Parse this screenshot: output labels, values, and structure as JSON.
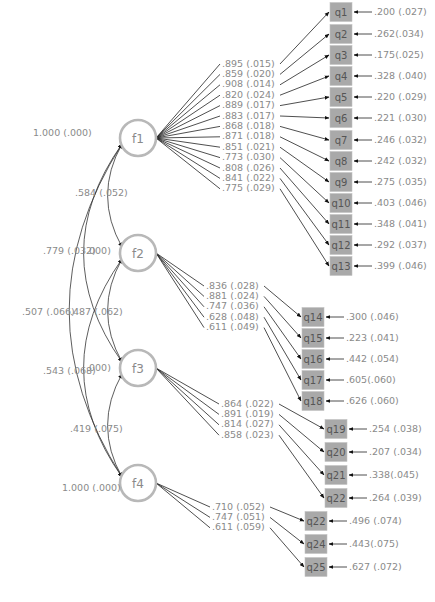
{
  "diagram": {
    "type": "confirmatory factor analysis path diagram",
    "factors": [
      {
        "id": "f1",
        "label": "f1",
        "variance": "1.000 (.000)",
        "cx": 138,
        "cy": 138
      },
      {
        "id": "f2",
        "label": "f2",
        "variance": ".000)",
        "cx": 138,
        "cy": 253
      },
      {
        "id": "f3",
        "label": "f3",
        "variance": ".000)",
        "cx": 138,
        "cy": 368
      },
      {
        "id": "f4",
        "label": "f4",
        "variance": "1.000 (.000)",
        "cx": 138,
        "cy": 483
      }
    ],
    "correlations": [
      {
        "from": "f1",
        "to": "f2",
        "label": ".584 (.052)"
      },
      {
        "from": "f1",
        "to": "f3",
        "label": ".779 (.032)"
      },
      {
        "from": "f1",
        "to": "f4",
        "label": ".507 (.066)"
      },
      {
        "from": "f2",
        "to": "f3",
        "label": ".487 (.062)"
      },
      {
        "from": "f2",
        "to": "f4",
        "label": ".543 (.068)"
      },
      {
        "from": "f3",
        "to": "f4",
        "label": ".419 (.075)"
      }
    ],
    "groups": [
      {
        "factor": "f1",
        "box_x": 330,
        "loading_label_x": 222,
        "loading_label_y0": 64,
        "items": [
          {
            "label": "q1",
            "loading": ".895 (.015)",
            "residual": ".200 (.027)",
            "y": 12
          },
          {
            "label": "q2",
            "loading": ".859 (.020)",
            "residual": ".262(.034)",
            "y": 34
          },
          {
            "label": "q3",
            "loading": ".908 (.014)",
            "residual": ".175(.025)",
            "y": 55
          },
          {
            "label": "q4",
            "loading": ".820 (.024)",
            "residual": ".328 (.040)",
            "y": 76
          },
          {
            "label": "q5",
            "loading": ".889 (.017)",
            "residual": ".220 (.029)",
            "y": 97
          },
          {
            "label": "q6",
            "loading": ".883 (.017)",
            "residual": ".221 (.030)",
            "y": 118
          },
          {
            "label": "q7",
            "loading": ".868 (.018)",
            "residual": ".246 (.032)",
            "y": 140
          },
          {
            "label": "q8",
            "loading": ".871 (.018)",
            "residual": ".242 (.032)",
            "y": 161
          },
          {
            "label": "q9",
            "loading": ".851 (.021)",
            "residual": ".275 (.035)",
            "y": 182
          },
          {
            "label": "q10",
            "loading": ".773 (.030)",
            "residual": ".403 (.046)",
            "y": 203
          },
          {
            "label": "q11",
            "loading": ".808 (.026)",
            "residual": ".348 (.041)",
            "y": 224
          },
          {
            "label": "q12",
            "loading": ".841 (.022)",
            "residual": ".292 (.037)",
            "y": 245
          },
          {
            "label": "q13",
            "loading": ".775 (.029)",
            "residual": ".399 (.046)",
            "y": 266
          }
        ]
      },
      {
        "factor": "f2",
        "box_x": 302,
        "loading_label_x": 206,
        "loading_label_y0": 286,
        "items": [
          {
            "label": "q14",
            "loading": ".836 (.028)",
            "residual": ".300 (.046)",
            "y": 317
          },
          {
            "label": "q15",
            "loading": ".881 (.024)",
            "residual": ".223 (.041)",
            "y": 338
          },
          {
            "label": "q16",
            "loading": ".747 (.036)",
            "residual": ".442 (.054)",
            "y": 359
          },
          {
            "label": "q17",
            "loading": ".628 (.048)",
            "residual": ".605(.060)",
            "y": 380
          },
          {
            "label": "q18",
            "loading": ".611 (.049)",
            "residual": ".626 (.060)",
            "y": 401
          }
        ]
      },
      {
        "factor": "f3",
        "box_x": 325,
        "loading_label_x": 221,
        "loading_label_y0": 404,
        "items": [
          {
            "label": "q19",
            "loading": ".864 (.022)",
            "residual": ".254 (.038)",
            "y": 429
          },
          {
            "label": "q20",
            "loading": ".891 (.019)",
            "residual": ".207 (.034)",
            "y": 452
          },
          {
            "label": "q21",
            "loading": ".814 (.027)",
            "residual": ".338(.045)",
            "y": 475
          },
          {
            "label": "q22",
            "loading": ".858 (.023)",
            "residual": ".264 (.039)",
            "y": 498
          }
        ]
      },
      {
        "factor": "f4",
        "box_x": 305,
        "loading_label_x": 212,
        "loading_label_y0": 507,
        "items": [
          {
            "label": "q22",
            "loading": ".710 (.052)",
            "residual": ".496 (.074)",
            "y": 521
          },
          {
            "label": "q24",
            "loading": ".747 (.051)",
            "residual": ".443(.075)",
            "y": 544
          },
          {
            "label": "q25",
            "loading": ".611 (.059)",
            "residual": ".627 (.072)",
            "y": 567
          }
        ]
      }
    ],
    "colors": {
      "factor_stroke": "#b8b8b8",
      "item_fill": "#a9a9a9",
      "text": "#8a8a8a",
      "lines": "#222222"
    }
  }
}
